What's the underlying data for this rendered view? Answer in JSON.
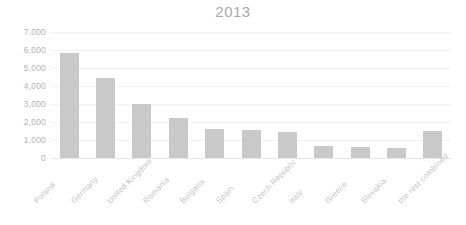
{
  "chart_data": {
    "type": "bar",
    "title": "2013",
    "xlabel": "",
    "ylabel": "",
    "ylim": [
      0,
      7000
    ],
    "ytick_step": 1000,
    "grid": true,
    "legend": "none",
    "bar_color": "#c9c9c9",
    "categories": [
      "Poland",
      "Germany",
      "United Kingdom",
      "Romania",
      "Bulgaria",
      "Spain",
      "Czech Republic",
      "Italy",
      "Greece",
      "Slovakia",
      "the rest combined"
    ],
    "values": [
      5800,
      4400,
      2950,
      2200,
      1600,
      1550,
      1420,
      620,
      560,
      540,
      1480
    ],
    "ytick_labels": [
      "0",
      "1,000",
      "2,000",
      "3,000",
      "4,000",
      "5,000",
      "6,000",
      "7,000"
    ],
    "ytick_values": [
      0,
      1000,
      2000,
      3000,
      4000,
      5000,
      6000,
      7000
    ]
  },
  "colors": {
    "bar": "#c9c9c9",
    "grid": "#f1f1f1",
    "axis_text": "#b4b4b4",
    "title_text": "#a8a8a8",
    "category_text": "#c3c3c3",
    "background": "#ffffff"
  }
}
